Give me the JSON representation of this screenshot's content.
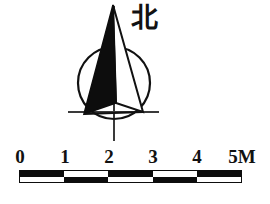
{
  "figure": {
    "kind": "map-marginalia",
    "background_color": "#ffffff",
    "ink_color": "#0d0d0d"
  },
  "north_arrow": {
    "label": "北",
    "label_meaning": "north",
    "circle": {
      "cx": 114,
      "cy": 83,
      "r": 36
    },
    "needle_tip": {
      "x": 113,
      "y": 5
    },
    "needle_base_left": {
      "x": 84,
      "y": 114
    },
    "needle_base_right": {
      "x": 143,
      "y": 112
    },
    "needle_center": {
      "x": 116,
      "y": 103
    },
    "vertical_axis": {
      "x": 114,
      "y_top": 5,
      "y_bottom": 141
    },
    "horizontal_axis": {
      "y": 112,
      "x_left": 68,
      "x_right": 159
    }
  },
  "scale_bar": {
    "units_label": "M",
    "end_label": "5M",
    "tick_labels": [
      "0",
      "1",
      "2",
      "3",
      "4",
      "5M"
    ],
    "tick_values": [
      0,
      1,
      2,
      3,
      4,
      5
    ],
    "segments": 5,
    "segment_length_units": 1,
    "max_value": 5,
    "bar_left_px": 19,
    "bar_right_px": 242,
    "bar_top_px": 170,
    "bar_height_px": 13,
    "pattern": "checkerboard-two-row",
    "top_row_fill": [
      true,
      false,
      true,
      false,
      true
    ],
    "bottom_row_fill": [
      false,
      true,
      false,
      true,
      false
    ],
    "fill_color": "#0d0d0d",
    "blank_color": "#ffffff",
    "border_color": "#0d0d0d"
  }
}
